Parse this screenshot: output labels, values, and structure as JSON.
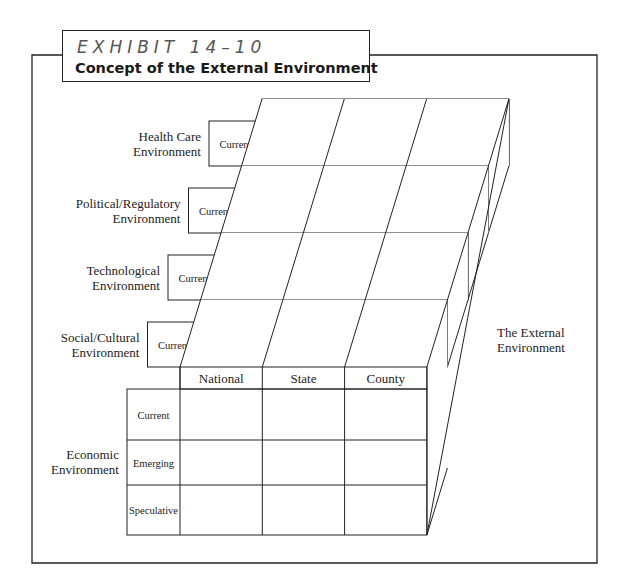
{
  "exhibit": {
    "number_label": "EXHIBIT 14–10",
    "title": "Concept of the External Environment"
  },
  "diagram": {
    "columns": [
      "National",
      "State",
      "County"
    ],
    "external_label_line1": "The External",
    "external_label_line2": "Environment",
    "layers": [
      {
        "name_line1": "Health Care",
        "name_line2": "Environment",
        "rows": [
          "Current"
        ]
      },
      {
        "name_line1": "Political/Regulatory",
        "name_line2": "Environment",
        "rows": [
          "Current"
        ]
      },
      {
        "name_line1": "Technological",
        "name_line2": "Environment",
        "rows": [
          "Current"
        ]
      },
      {
        "name_line1": "Social/Cultural",
        "name_line2": "Environment",
        "rows": [
          "Current"
        ]
      },
      {
        "name_line1": "Economic",
        "name_line2": "Environment",
        "rows": [
          "Current",
          "Emerging",
          "Speculative"
        ]
      }
    ]
  }
}
